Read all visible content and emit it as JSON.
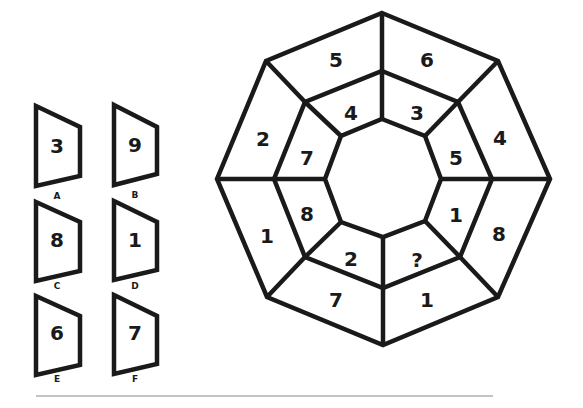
{
  "puzzle": {
    "type": "octagon-ring-missing-number",
    "outer_ring": {
      "top_left": "5",
      "top_right": "6",
      "right_upper": "4",
      "right_lower": "8",
      "bottom_right": "1",
      "bottom_left": "7",
      "left_lower": "1",
      "left_upper": "2"
    },
    "inner_ring": {
      "top_left": "4",
      "top_right": "3",
      "right_upper": "5",
      "right_lower": "1",
      "bottom_right": "?",
      "bottom_left": "2",
      "left_lower": "8",
      "left_upper": "7"
    }
  },
  "options": [
    {
      "letter": "A",
      "value": "3"
    },
    {
      "letter": "B",
      "value": "9"
    },
    {
      "letter": "C",
      "value": "8"
    },
    {
      "letter": "D",
      "value": "1"
    },
    {
      "letter": "E",
      "value": "6"
    },
    {
      "letter": "F",
      "value": "7"
    }
  ],
  "colors": {
    "stroke": "#1a1a1a",
    "background": "#ffffff",
    "divider": "#888888"
  }
}
